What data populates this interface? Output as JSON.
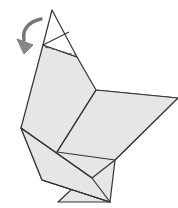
{
  "diagram": {
    "paper_color": "#e6e6e6",
    "line_color": "#333333",
    "arrow_color": "#888888",
    "instruction": "fold head tip down",
    "icons": {
      "fold_arrow": "curved-fold-arrow-icon",
      "fold_line": "dashed-fold-line"
    }
  }
}
